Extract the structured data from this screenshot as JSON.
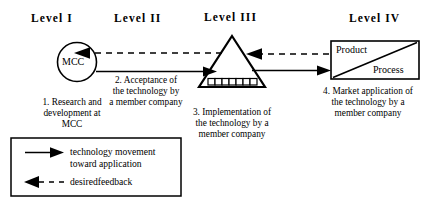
{
  "diagram": {
    "title_levels": [
      {
        "id": "level-1",
        "label": "Level I"
      },
      {
        "id": "level-2",
        "label": "Level II"
      },
      {
        "id": "level-3",
        "label": "Level III"
      },
      {
        "id": "level-4",
        "label": "Level IV"
      }
    ],
    "nodes": {
      "mcc": {
        "label": "MCC"
      },
      "product_process": {
        "top_label": "Product",
        "bottom_label": "Process"
      }
    },
    "captions": {
      "step1": {
        "line1": "1. Research and",
        "line2": "development at",
        "line3": "MCC"
      },
      "step2": {
        "line1": "2. Acceptance of",
        "line2": "the technology by",
        "line3": "a member company"
      },
      "step3": {
        "line1": "3. Implementation of",
        "line2": "the technology by a",
        "line3": "member company"
      },
      "step4": {
        "line1": "4. Market application of",
        "line2": "the technology by a",
        "line3": "member company"
      }
    },
    "legend": {
      "solid": {
        "line1": "technology movement",
        "line2": "toward application"
      },
      "dashed": {
        "line1": "desiredfeedback"
      }
    },
    "colors": {
      "stroke": "#000000",
      "background": "#ffffff",
      "text": "#000000"
    }
  }
}
